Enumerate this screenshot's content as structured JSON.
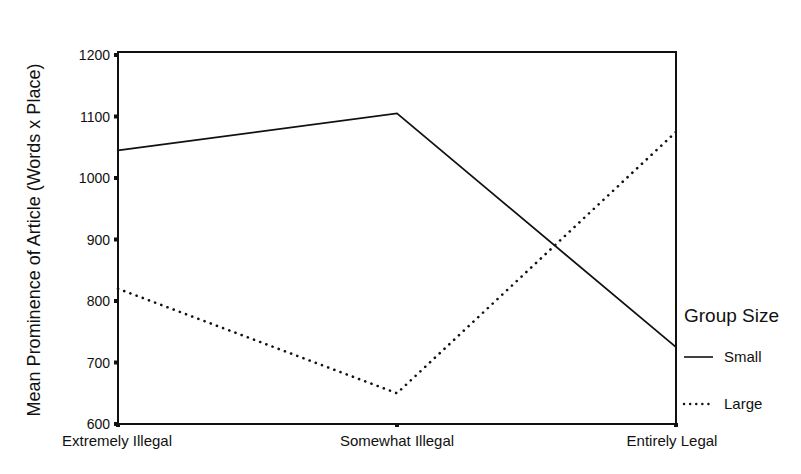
{
  "chart_data": {
    "type": "line",
    "title": "",
    "xlabel": "",
    "ylabel": "Mean Prominence of Article (Words x Place)",
    "categories": [
      "Extremely Illegal",
      "Somewhat Illegal",
      "Entirely Legal"
    ],
    "ylim": [
      600,
      1200
    ],
    "yticks": [
      600,
      700,
      800,
      900,
      1000,
      1100,
      1200
    ],
    "grid": false,
    "legend": {
      "title": "Group Size",
      "position": "right"
    },
    "series": [
      {
        "name": "Small",
        "style": "solid",
        "values": [
          1045,
          1105,
          725
        ]
      },
      {
        "name": "Large",
        "style": "dotted",
        "values": [
          820,
          650,
          1075
        ]
      }
    ]
  },
  "colors": {
    "line": "#111111",
    "background": "#ffffff"
  }
}
